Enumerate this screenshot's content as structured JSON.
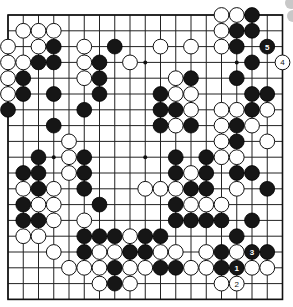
{
  "game": {
    "type": "go",
    "board_size": 19,
    "colors": {
      "black": "#161616",
      "white": "#ffffff",
      "line": "#222222",
      "background": "#ffffff"
    },
    "star_points": [
      [
        3,
        3
      ],
      [
        3,
        9
      ],
      [
        3,
        15
      ],
      [
        9,
        3
      ],
      [
        9,
        9
      ],
      [
        9,
        15
      ],
      [
        15,
        3
      ],
      [
        15,
        9
      ],
      [
        15,
        15
      ]
    ],
    "stones": [
      {
        "r": 0,
        "c": 14,
        "color": "W"
      },
      {
        "r": 0,
        "c": 15,
        "color": "W"
      },
      {
        "r": 0,
        "c": 16,
        "color": "B"
      },
      {
        "r": 1,
        "c": 1,
        "color": "W"
      },
      {
        "r": 1,
        "c": 2,
        "color": "W"
      },
      {
        "r": 1,
        "c": 3,
        "color": "W"
      },
      {
        "r": 1,
        "c": 14,
        "color": "W"
      },
      {
        "r": 1,
        "c": 15,
        "color": "B"
      },
      {
        "r": 1,
        "c": 16,
        "color": "B"
      },
      {
        "r": 2,
        "c": 0,
        "color": "W"
      },
      {
        "r": 2,
        "c": 2,
        "color": "W"
      },
      {
        "r": 2,
        "c": 3,
        "color": "B"
      },
      {
        "r": 2,
        "c": 5,
        "color": "W"
      },
      {
        "r": 2,
        "c": 7,
        "color": "B"
      },
      {
        "r": 2,
        "c": 10,
        "color": "W"
      },
      {
        "r": 2,
        "c": 12,
        "color": "W"
      },
      {
        "r": 2,
        "c": 14,
        "color": "W"
      },
      {
        "r": 2,
        "c": 15,
        "color": "B"
      },
      {
        "r": 2,
        "c": 17,
        "color": "B",
        "label": "5"
      },
      {
        "r": 3,
        "c": 0,
        "color": "W"
      },
      {
        "r": 3,
        "c": 1,
        "color": "W"
      },
      {
        "r": 3,
        "c": 2,
        "color": "B"
      },
      {
        "r": 3,
        "c": 3,
        "color": "B"
      },
      {
        "r": 3,
        "c": 5,
        "color": "W"
      },
      {
        "r": 3,
        "c": 6,
        "color": "B"
      },
      {
        "r": 3,
        "c": 8,
        "color": "W"
      },
      {
        "r": 3,
        "c": 16,
        "color": "B"
      },
      {
        "r": 3,
        "c": 18,
        "color": "W",
        "label": "4"
      },
      {
        "r": 4,
        "c": 0,
        "color": "W"
      },
      {
        "r": 4,
        "c": 1,
        "color": "B"
      },
      {
        "r": 4,
        "c": 5,
        "color": "W"
      },
      {
        "r": 4,
        "c": 6,
        "color": "B"
      },
      {
        "r": 4,
        "c": 11,
        "color": "W"
      },
      {
        "r": 4,
        "c": 12,
        "color": "B"
      },
      {
        "r": 4,
        "c": 15,
        "color": "B"
      },
      {
        "r": 5,
        "c": 0,
        "color": "W"
      },
      {
        "r": 5,
        "c": 1,
        "color": "B"
      },
      {
        "r": 5,
        "c": 3,
        "color": "B"
      },
      {
        "r": 5,
        "c": 6,
        "color": "B"
      },
      {
        "r": 5,
        "c": 10,
        "color": "B"
      },
      {
        "r": 5,
        "c": 11,
        "color": "W"
      },
      {
        "r": 5,
        "c": 12,
        "color": "W"
      },
      {
        "r": 5,
        "c": 16,
        "color": "B"
      },
      {
        "r": 5,
        "c": 17,
        "color": "B"
      },
      {
        "r": 6,
        "c": 0,
        "color": "B"
      },
      {
        "r": 6,
        "c": 5,
        "color": "B"
      },
      {
        "r": 6,
        "c": 10,
        "color": "B"
      },
      {
        "r": 6,
        "c": 11,
        "color": "B"
      },
      {
        "r": 6,
        "c": 12,
        "color": "W"
      },
      {
        "r": 6,
        "c": 14,
        "color": "W"
      },
      {
        "r": 6,
        "c": 15,
        "color": "W"
      },
      {
        "r": 6,
        "c": 16,
        "color": "B"
      },
      {
        "r": 6,
        "c": 17,
        "color": "W"
      },
      {
        "r": 7,
        "c": 3,
        "color": "B"
      },
      {
        "r": 7,
        "c": 10,
        "color": "B"
      },
      {
        "r": 7,
        "c": 11,
        "color": "W"
      },
      {
        "r": 7,
        "c": 12,
        "color": "B"
      },
      {
        "r": 7,
        "c": 14,
        "color": "W"
      },
      {
        "r": 7,
        "c": 15,
        "color": "B"
      },
      {
        "r": 7,
        "c": 16,
        "color": "W"
      },
      {
        "r": 8,
        "c": 4,
        "color": "W"
      },
      {
        "r": 8,
        "c": 14,
        "color": "W"
      },
      {
        "r": 8,
        "c": 15,
        "color": "B"
      },
      {
        "r": 8,
        "c": 17,
        "color": "W"
      },
      {
        "r": 9,
        "c": 2,
        "color": "B"
      },
      {
        "r": 9,
        "c": 4,
        "color": "W"
      },
      {
        "r": 9,
        "c": 5,
        "color": "B"
      },
      {
        "r": 9,
        "c": 11,
        "color": "B"
      },
      {
        "r": 9,
        "c": 13,
        "color": "B"
      },
      {
        "r": 9,
        "c": 14,
        "color": "W"
      },
      {
        "r": 9,
        "c": 15,
        "color": "W"
      },
      {
        "r": 10,
        "c": 1,
        "color": "B"
      },
      {
        "r": 10,
        "c": 2,
        "color": "B"
      },
      {
        "r": 10,
        "c": 4,
        "color": "W"
      },
      {
        "r": 10,
        "c": 5,
        "color": "B"
      },
      {
        "r": 10,
        "c": 11,
        "color": "B"
      },
      {
        "r": 10,
        "c": 12,
        "color": "W"
      },
      {
        "r": 10,
        "c": 13,
        "color": "B"
      },
      {
        "r": 10,
        "c": 15,
        "color": "B"
      },
      {
        "r": 10,
        "c": 16,
        "color": "B"
      },
      {
        "r": 11,
        "c": 1,
        "color": "W"
      },
      {
        "r": 11,
        "c": 2,
        "color": "B"
      },
      {
        "r": 11,
        "c": 3,
        "color": "W"
      },
      {
        "r": 11,
        "c": 5,
        "color": "B"
      },
      {
        "r": 11,
        "c": 9,
        "color": "W"
      },
      {
        "r": 11,
        "c": 10,
        "color": "W"
      },
      {
        "r": 11,
        "c": 11,
        "color": "W"
      },
      {
        "r": 11,
        "c": 12,
        "color": "B"
      },
      {
        "r": 11,
        "c": 13,
        "color": "B"
      },
      {
        "r": 11,
        "c": 15,
        "color": "W"
      },
      {
        "r": 11,
        "c": 17,
        "color": "B"
      },
      {
        "r": 12,
        "c": 1,
        "color": "B"
      },
      {
        "r": 12,
        "c": 2,
        "color": "W"
      },
      {
        "r": 12,
        "c": 3,
        "color": "W"
      },
      {
        "r": 12,
        "c": 6,
        "color": "B"
      },
      {
        "r": 12,
        "c": 11,
        "color": "B"
      },
      {
        "r": 12,
        "c": 12,
        "color": "W"
      },
      {
        "r": 12,
        "c": 13,
        "color": "W"
      },
      {
        "r": 12,
        "c": 14,
        "color": "W"
      },
      {
        "r": 13,
        "c": 1,
        "color": "B"
      },
      {
        "r": 13,
        "c": 2,
        "color": "B"
      },
      {
        "r": 13,
        "c": 3,
        "color": "W"
      },
      {
        "r": 13,
        "c": 5,
        "color": "W"
      },
      {
        "r": 13,
        "c": 11,
        "color": "B"
      },
      {
        "r": 13,
        "c": 12,
        "color": "B"
      },
      {
        "r": 13,
        "c": 13,
        "color": "B"
      },
      {
        "r": 13,
        "c": 14,
        "color": "B"
      },
      {
        "r": 13,
        "c": 16,
        "color": "B"
      },
      {
        "r": 14,
        "c": 1,
        "color": "W"
      },
      {
        "r": 14,
        "c": 2,
        "color": "W"
      },
      {
        "r": 14,
        "c": 5,
        "color": "B"
      },
      {
        "r": 14,
        "c": 6,
        "color": "B"
      },
      {
        "r": 14,
        "c": 7,
        "color": "B"
      },
      {
        "r": 14,
        "c": 8,
        "color": "W"
      },
      {
        "r": 14,
        "c": 9,
        "color": "B"
      },
      {
        "r": 14,
        "c": 10,
        "color": "B"
      },
      {
        "r": 14,
        "c": 15,
        "color": "B"
      },
      {
        "r": 15,
        "c": 3,
        "color": "W"
      },
      {
        "r": 15,
        "c": 5,
        "color": "B"
      },
      {
        "r": 15,
        "c": 6,
        "color": "W"
      },
      {
        "r": 15,
        "c": 7,
        "color": "W"
      },
      {
        "r": 15,
        "c": 8,
        "color": "B"
      },
      {
        "r": 15,
        "c": 9,
        "color": "B"
      },
      {
        "r": 15,
        "c": 10,
        "color": "W"
      },
      {
        "r": 15,
        "c": 11,
        "color": "W"
      },
      {
        "r": 15,
        "c": 13,
        "color": "W"
      },
      {
        "r": 15,
        "c": 14,
        "color": "B"
      },
      {
        "r": 15,
        "c": 15,
        "color": "W"
      },
      {
        "r": 15,
        "c": 16,
        "color": "B",
        "label": "3"
      },
      {
        "r": 15,
        "c": 17,
        "color": "B"
      },
      {
        "r": 16,
        "c": 4,
        "color": "W"
      },
      {
        "r": 16,
        "c": 5,
        "color": "W"
      },
      {
        "r": 16,
        "c": 6,
        "color": "W"
      },
      {
        "r": 16,
        "c": 7,
        "color": "B"
      },
      {
        "r": 16,
        "c": 8,
        "color": "W"
      },
      {
        "r": 16,
        "c": 9,
        "color": "W"
      },
      {
        "r": 16,
        "c": 10,
        "color": "B"
      },
      {
        "r": 16,
        "c": 11,
        "color": "B"
      },
      {
        "r": 16,
        "c": 12,
        "color": "W"
      },
      {
        "r": 16,
        "c": 13,
        "color": "W"
      },
      {
        "r": 16,
        "c": 14,
        "color": "B"
      },
      {
        "r": 16,
        "c": 15,
        "color": "B",
        "label": "1"
      },
      {
        "r": 16,
        "c": 16,
        "color": "W"
      },
      {
        "r": 16,
        "c": 17,
        "color": "W"
      },
      {
        "r": 17,
        "c": 6,
        "color": "W"
      },
      {
        "r": 17,
        "c": 7,
        "color": "B"
      },
      {
        "r": 17,
        "c": 8,
        "color": "W"
      },
      {
        "r": 17,
        "c": 14,
        "color": "W"
      },
      {
        "r": 17,
        "c": 15,
        "color": "W",
        "label": "2"
      }
    ],
    "move_labels": [
      "1",
      "2",
      "3",
      "4",
      "5"
    ]
  }
}
